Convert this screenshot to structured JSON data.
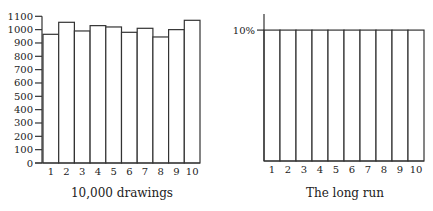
{
  "chart_data": [
    {
      "type": "bar",
      "title": "",
      "caption": "10,000 drawings",
      "xlabel": "10,000 drawings",
      "ylabel": "",
      "categories": [
        "1",
        "2",
        "3",
        "4",
        "5",
        "6",
        "7",
        "8",
        "9",
        "10"
      ],
      "values": [
        965,
        1055,
        990,
        1030,
        1020,
        980,
        1010,
        945,
        1000,
        1070
      ],
      "ylim": [
        0,
        1100
      ],
      "yticks": [
        0,
        100,
        200,
        300,
        400,
        500,
        600,
        700,
        800,
        900,
        1000,
        1100
      ],
      "grid": false,
      "legend": null
    },
    {
      "type": "bar",
      "title": "",
      "caption": "The long run",
      "xlabel": "The long run",
      "ylabel": "",
      "categories": [
        "1",
        "2",
        "3",
        "4",
        "5",
        "6",
        "7",
        "8",
        "9",
        "10"
      ],
      "values": [
        10,
        10,
        10,
        10,
        10,
        10,
        10,
        10,
        10,
        10
      ],
      "value_unit": "%",
      "ylim": [
        0,
        11
      ],
      "yticks": [
        10
      ],
      "ytick_labels": [
        "10%"
      ],
      "grid": false,
      "legend": null
    }
  ]
}
